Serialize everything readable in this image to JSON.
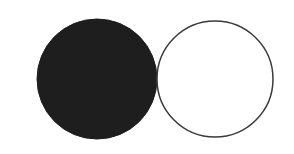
{
  "diagram": {
    "shapes": [
      {
        "type": "circle",
        "fill": "#1e1e1e",
        "stroke": "#1e1e1e",
        "cx": 97,
        "cy": 79,
        "r": 60
      },
      {
        "type": "circle",
        "fill": "#ffffff",
        "stroke": "#3a3a3a",
        "cx": 215,
        "cy": 79,
        "r": 58
      }
    ],
    "background": "#ffffff"
  }
}
